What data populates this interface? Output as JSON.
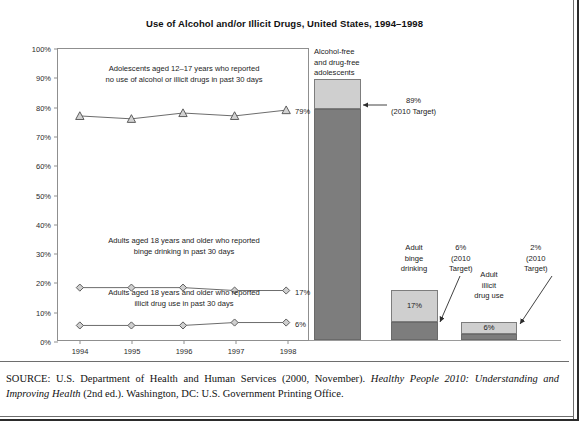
{
  "title": "Use of Alcohol and/or Illicit Drugs, United States, 1994–1998",
  "source": {
    "prefix": "SOURCE: U.S. Department of Health and Human Services (2000, November). ",
    "italic1": "Healthy People 2010: Understanding and Improving Health",
    "suffix": " (2nd ed.). Washington, DC: U.S. Government Printing Office."
  },
  "line_panel": {
    "y_ticks": [
      "100%",
      "90%",
      "80%",
      "70%",
      "60%",
      "50%",
      "40%",
      "30%",
      "20%",
      "10%",
      "0%"
    ],
    "x_ticks": [
      "1994",
      "1995",
      "1996",
      "1997",
      "1998"
    ],
    "notes": {
      "adolescent": "Adolescents aged 12–17 years who reported\nno use of alcohol or illicit drugs in past 30 days",
      "binge": "Adults aged 18 years and older who reported\nbinge drinking in past 30 days",
      "illicit": "Adults aged 18 years and older who reported\nillicit drug use in past 30 days"
    },
    "end_labels": {
      "adolescent": "79%",
      "binge": "17%",
      "illicit": "6%"
    }
  },
  "bar_panel": {
    "bars": [
      {
        "caption": "Alcohol-free\nand drug-free\nadolescents",
        "value_label": "",
        "current": 79,
        "target": 89,
        "target_note": "89%\n(2010 Target)"
      },
      {
        "caption": "Adult\nbinge\ndrinking",
        "value_label": "17%",
        "current": 17,
        "target": 6,
        "target_note": "6%\n(2010\nTarget)"
      },
      {
        "caption": "Adult\nillicit\ndrug use",
        "value_label": "6%",
        "current": 6,
        "target": 2,
        "target_note": "2%\n(2010\nTarget)"
      }
    ]
  },
  "colors": {
    "light_fill": "#cfcfcf",
    "dark_fill": "#7d7d7d",
    "axis": "#8f8f8f",
    "text": "#1a1a1a"
  },
  "chart_data": {
    "type": "line",
    "title": "Use of Alcohol and/or Illicit Drugs, United States, 1994–1998",
    "xlabel": "",
    "ylabel": "",
    "x": [
      "1994",
      "1995",
      "1996",
      "1997",
      "1998"
    ],
    "ylim": [
      0,
      100
    ],
    "ytick_step": 10,
    "grid": false,
    "legend": "none (inline series annotations)",
    "series": [
      {
        "name": "Adolescents aged 12–17 years who reported no use of alcohol or illicit drugs in past 30 days",
        "marker": "triangle",
        "values": [
          77,
          76,
          78,
          77,
          79
        ],
        "end_label": "79%"
      },
      {
        "name": "Adults aged 18 years and older who reported binge drinking in past 30 days",
        "marker": "diamond",
        "values": [
          18,
          18,
          18,
          17,
          17
        ],
        "end_label": "17%"
      },
      {
        "name": "Adults aged 18 years and older who reported illicit drug use in past 30 days",
        "marker": "diamond",
        "values": [
          5,
          5,
          5,
          6,
          6
        ],
        "end_label": "6%"
      }
    ],
    "companion_bars": {
      "type": "bar",
      "categories": [
        "Alcohol-free and drug-free adolescents",
        "Adult binge drinking",
        "Adult illicit drug use"
      ],
      "current_values": [
        79,
        17,
        6
      ],
      "target_values": [
        89,
        6,
        2
      ],
      "target_labels": [
        "89% (2010 Target)",
        "6% (2010 Target)",
        "2% (2010 Target)"
      ],
      "value_labels": [
        "",
        "17%",
        "6%"
      ]
    }
  }
}
